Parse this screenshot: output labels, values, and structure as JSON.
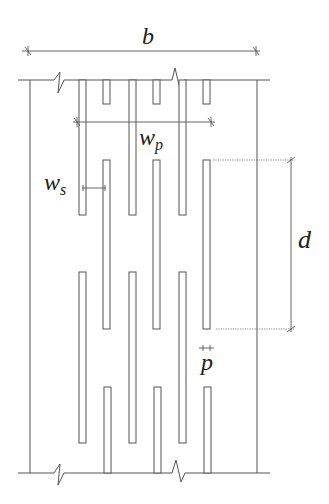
{
  "figure": {
    "labels": {
      "b": "b",
      "wp_main": "w",
      "wp_sub": "p",
      "ws_main": "w",
      "ws_sub": "s",
      "d": "d",
      "p": "p"
    },
    "colors": {
      "line": "#555555",
      "text": "#222222",
      "background": "#ffffff"
    }
  }
}
